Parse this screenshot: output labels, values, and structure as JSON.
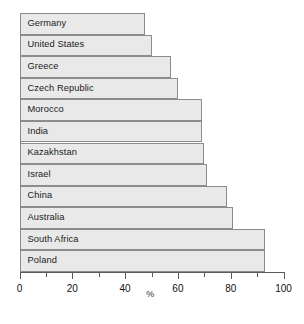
{
  "chart_data": {
    "type": "bar",
    "orientation": "horizontal",
    "title": "",
    "xlabel": "%",
    "ylabel": "",
    "xlim": [
      0,
      100
    ],
    "xticks": [
      0,
      20,
      40,
      60,
      80,
      100
    ],
    "xtick_labels": [
      "0",
      "20",
      "40",
      "60",
      "80",
      "100"
    ],
    "minor_xticks": [
      10,
      30,
      50,
      70,
      90
    ],
    "grid": false,
    "legend": false,
    "bar_fill_color": "#e9e9e9",
    "bar_edge_color": "#8c8c8c",
    "axis_color": "#5a5a5a",
    "categories": [
      "Germany",
      "United States",
      "Greece",
      "Czech Republic",
      "Morocco",
      "India",
      "Kazakhstan",
      "Israel",
      "China",
      "Australia",
      "South Africa",
      "Poland"
    ],
    "values": [
      47.5,
      50,
      57.5,
      60,
      69,
      69,
      70,
      71,
      78.5,
      81,
      93,
      93
    ]
  }
}
